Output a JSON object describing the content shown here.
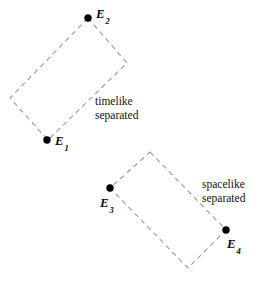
{
  "figure": {
    "background_color": "#ffffff",
    "width": 262,
    "height": 281,
    "dash_color": "#9a9a9a",
    "dot_color": "#000000",
    "text_color": "#111111"
  },
  "events": [
    {
      "id": "E1",
      "base": "E",
      "subscript": "1",
      "dot_x": 47,
      "dot_y": 140,
      "label_x": 55,
      "label_y": 134
    },
    {
      "id": "E2",
      "base": "E",
      "subscript": "2",
      "dot_x": 88,
      "dot_y": 18,
      "label_x": 96,
      "label_y": 7
    },
    {
      "id": "E3",
      "base": "E",
      "subscript": "3",
      "dot_x": 110,
      "dot_y": 188,
      "label_x": 100,
      "label_y": 196
    },
    {
      "id": "E4",
      "base": "E",
      "subscript": "4",
      "dot_x": 226,
      "dot_y": 230,
      "label_x": 227,
      "label_y": 237
    }
  ],
  "regions": [
    {
      "id": "timelike-region",
      "points": "88,18 127,63 48,140 10,98",
      "caption_line_1": "timelike",
      "caption_line_2": "separated",
      "caption_x": 95,
      "caption_y": 95
    },
    {
      "id": "spacelike-region",
      "points": "150,152 226,230 188,268 110,188",
      "caption_line_1": "spacelike",
      "caption_line_2": "separated",
      "caption_x": 202,
      "caption_y": 178
    }
  ]
}
